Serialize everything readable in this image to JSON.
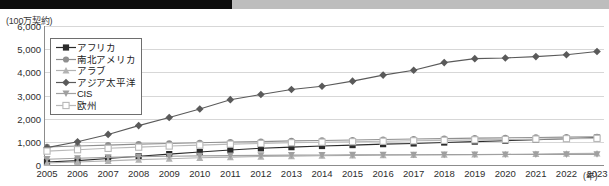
{
  "chart_data": {
    "type": "line",
    "title": "",
    "subtitle": "",
    "unit_label": "(100万契約)",
    "xlabel": "(年)",
    "ylabel": "",
    "grid": true,
    "legend_position": "upper-left-inside",
    "ylim": [
      0,
      6000
    ],
    "yticks": [
      "0",
      "1,000",
      "2,000",
      "3,000",
      "4,000",
      "5,000",
      "6,000"
    ],
    "ytick_values": [
      0,
      1000,
      2000,
      3000,
      4000,
      5000,
      6000
    ],
    "categories": [
      "2005",
      "2006",
      "2007",
      "2008",
      "2009",
      "2010",
      "2011",
      "2012",
      "2013",
      "2014",
      "2015",
      "2016",
      "2017",
      "2018",
      "2019",
      "2020",
      "2021",
      "2022",
      "2023"
    ],
    "series": [
      {
        "name": "アフリカ",
        "marker": "filled-square",
        "color": "#2b2b2b",
        "values": [
          130,
          190,
          280,
          380,
          470,
          560,
          650,
          720,
          770,
          820,
          860,
          900,
          930,
          970,
          1010,
          1050,
          1090,
          1130,
          1180
        ]
      },
      {
        "name": "南北アメリカ",
        "marker": "filled-circle",
        "color": "#8f8f8f",
        "values": [
          780,
          820,
          860,
          900,
          930,
          960,
          990,
          1010,
          1040,
          1060,
          1080,
          1100,
          1120,
          1140,
          1160,
          1170,
          1190,
          1205,
          1220
        ]
      },
      {
        "name": "アラブ",
        "marker": "filled-triangle",
        "color": "#b3b3b3",
        "values": [
          90,
          130,
          180,
          230,
          270,
          310,
          340,
          365,
          385,
          400,
          415,
          425,
          435,
          445,
          455,
          465,
          478,
          490,
          500
        ]
      },
      {
        "name": "アジア太平洋",
        "marker": "filled-diamond",
        "color": "#5a5a5a",
        "values": [
          750,
          1000,
          1320,
          1700,
          2050,
          2420,
          2820,
          3040,
          3260,
          3400,
          3620,
          3880,
          4090,
          4420,
          4590,
          4620,
          4680,
          4760,
          4900
        ]
      },
      {
        "name": "CIS",
        "marker": "filled-inverted-triangle",
        "color": "#a0a0a0",
        "values": [
          250,
          290,
          330,
          360,
          380,
          395,
          405,
          415,
          425,
          430,
          435,
          440,
          443,
          446,
          450,
          452,
          455,
          458,
          460
        ]
      },
      {
        "name": "欧州",
        "marker": "open-square",
        "color": "#b8b8b8",
        "values": [
          600,
          660,
          720,
          770,
          820,
          860,
          900,
          930,
          960,
          985,
          1005,
          1025,
          1045,
          1065,
          1085,
          1100,
          1118,
          1135,
          1150
        ]
      }
    ]
  }
}
